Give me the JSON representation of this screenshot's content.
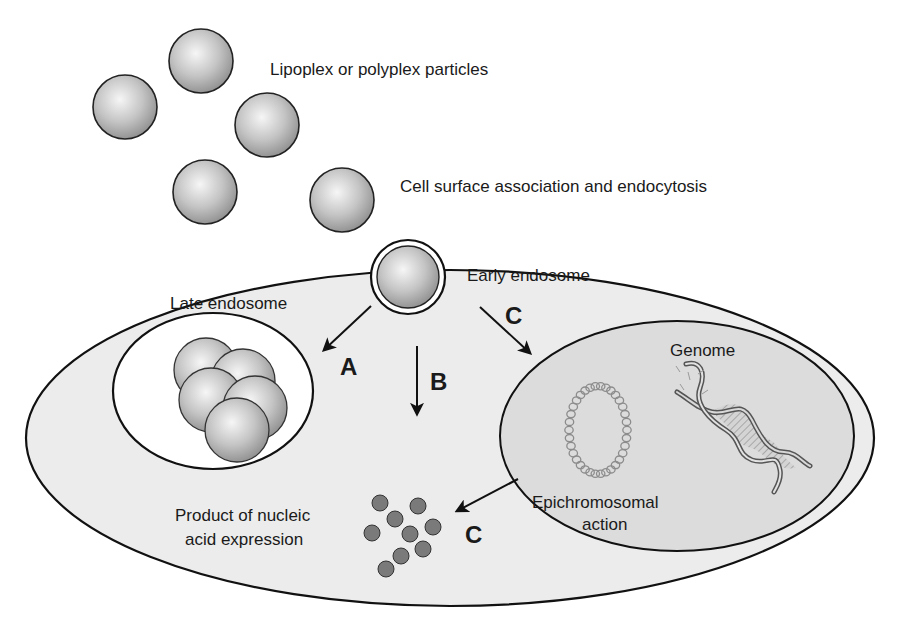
{
  "labels": {
    "particles": "Lipoplex or polyplex particles",
    "surface": "Cell surface association and endocytosis",
    "early_endosome": "Early endosome",
    "late_endosome": "Late endosome",
    "genome": "Genome",
    "epichromosomal_line1": "Epichromosomal",
    "epichromosomal_line2": "action",
    "product_line1": "Product of nucleic",
    "product_line2": "acid expression"
  },
  "pathways": {
    "a": "A",
    "b": "B",
    "c_upper": "C",
    "c_lower": "C"
  },
  "colors": {
    "cytoplasm": "#ececec",
    "nucleus": "#dcdcdc",
    "endosome_interior": "#ffffff",
    "particle_light": "#f4f4f4",
    "particle_dark": "#9a9a9a",
    "product_dot": "#7a7a7a",
    "outline": "#111111",
    "plasmid": "#8c8c8c"
  }
}
